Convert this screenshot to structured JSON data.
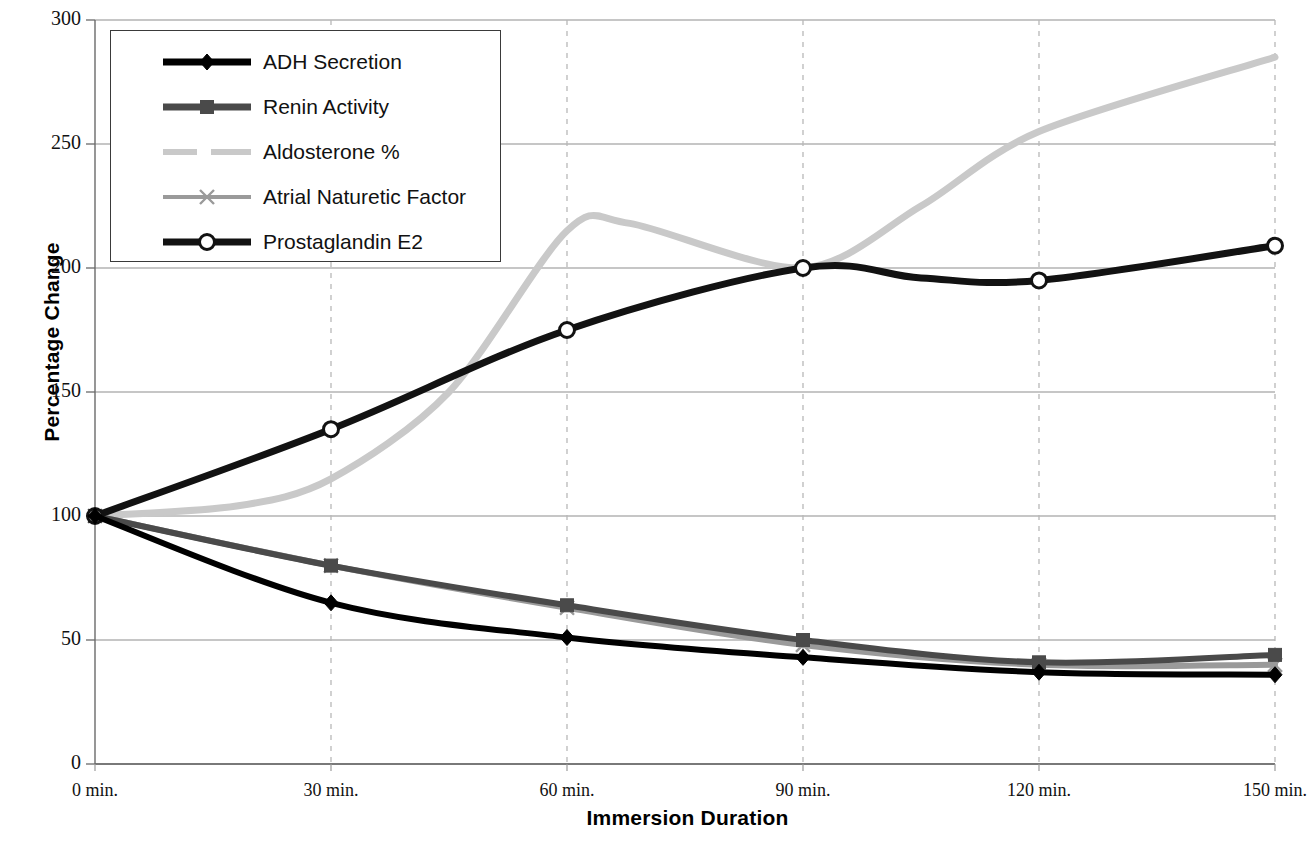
{
  "chart_data": {
    "type": "line",
    "title": "",
    "xlabel": "Immersion Duration",
    "ylabel": "Percentage Change",
    "x": [
      0,
      30,
      60,
      90,
      120,
      150
    ],
    "categories": [
      "0 min.",
      "30 min.",
      "60 min.",
      "90 min.",
      "120 min.",
      "150 min."
    ],
    "xtick_labels": [
      "0 min.",
      "30 min.",
      "60 min.",
      "90 min.",
      "120 min.",
      "150 min."
    ],
    "ytick_labels": [
      "300",
      "250",
      "200",
      "150",
      "100",
      "50",
      "0"
    ],
    "ylim": [
      0,
      300
    ],
    "ytick_step": 50,
    "grid": {
      "horizontal": true,
      "vertical": true,
      "vertical_style": "dashed"
    },
    "legend_position": "top-left",
    "series": [
      {
        "name": "ADH Secretion",
        "values": [
          100,
          65,
          51,
          43,
          37,
          36
        ],
        "color": "#000000",
        "marker": "diamond",
        "width": 6
      },
      {
        "name": "Renin Activity",
        "values": [
          100,
          80,
          64,
          50,
          41,
          44
        ],
        "color": "#4a4a4a",
        "marker": "square",
        "width": 6
      },
      {
        "name": "Aldosterone %",
        "values": [
          100,
          115,
          215,
          200,
          255,
          285
        ],
        "color": "#c9c9c9",
        "marker": "none",
        "width": 7
      },
      {
        "name": "Atrial Naturetic Factor",
        "values": [
          100,
          80,
          63,
          48,
          40,
          40
        ],
        "color": "#9a9a9a",
        "marker": "x",
        "width": 6
      },
      {
        "name": "Prostaglandin E2",
        "values": [
          100,
          135,
          175,
          200,
          195,
          209
        ],
        "color": "#121212",
        "marker": "circle-open",
        "width": 7
      }
    ],
    "annotations": {
      "aldosterone_peak": {
        "x": 68,
        "y": 218
      },
      "aldosterone_trough_after_peak": {
        "x": 90,
        "y": 200
      }
    }
  },
  "legend": {
    "items": [
      {
        "label": "ADH Secretion",
        "marker": "diamond-marker-icon"
      },
      {
        "label": "Renin Activity",
        "marker": "square-marker-icon"
      },
      {
        "label": "Aldosterone %",
        "marker": "dashed-line-icon"
      },
      {
        "label": "Atrial Naturetic Factor",
        "marker": "x-marker-icon"
      },
      {
        "label": "Prostaglandin E2",
        "marker": "circle-marker-icon"
      }
    ]
  },
  "axes": {
    "y_title": "Percentage Change",
    "x_title": "Immersion Duration"
  }
}
